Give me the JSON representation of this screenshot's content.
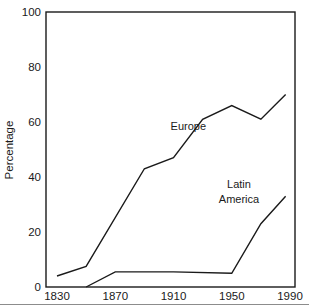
{
  "chart_data": {
    "type": "line",
    "title": "",
    "xlabel": "",
    "ylabel": "Percentage",
    "xlim": [
      1830,
      1990
    ],
    "ylim": [
      0,
      100
    ],
    "grid": false,
    "legend_position": "inline-annotations",
    "x_ticks": [
      "1830",
      "1870",
      "1910",
      "1950",
      "1990"
    ],
    "x_tick_values": [
      1830,
      1870,
      1910,
      1950,
      1990
    ],
    "y_ticks": [
      "0",
      "20",
      "40",
      "60",
      "80",
      "100"
    ],
    "y_tick_values": [
      0,
      20,
      40,
      60,
      80,
      100
    ],
    "series": [
      {
        "name": "Europe",
        "color": "#1a1a1a",
        "points": [
          [
            1830,
            4
          ],
          [
            1850,
            7.5
          ],
          [
            1890,
            43
          ],
          [
            1910,
            47
          ],
          [
            1930,
            61
          ],
          [
            1950,
            66
          ],
          [
            1970,
            61
          ],
          [
            1987,
            70
          ]
        ]
      },
      {
        "name": "Latin America",
        "color": "#1a1a1a",
        "points": [
          [
            1850,
            0
          ],
          [
            1870,
            5.5
          ],
          [
            1910,
            5.5
          ],
          [
            1950,
            5
          ],
          [
            1970,
            23
          ],
          [
            1987,
            33
          ]
        ]
      }
    ],
    "annotations": [
      {
        "text": "Europe",
        "x": 1908,
        "y": 57
      },
      {
        "text": "Latin",
        "x": 1955,
        "y": 36
      },
      {
        "text": "America",
        "x": 1955,
        "y": 30.5
      }
    ]
  },
  "axes": {
    "y_axis_title": "Percentage"
  }
}
